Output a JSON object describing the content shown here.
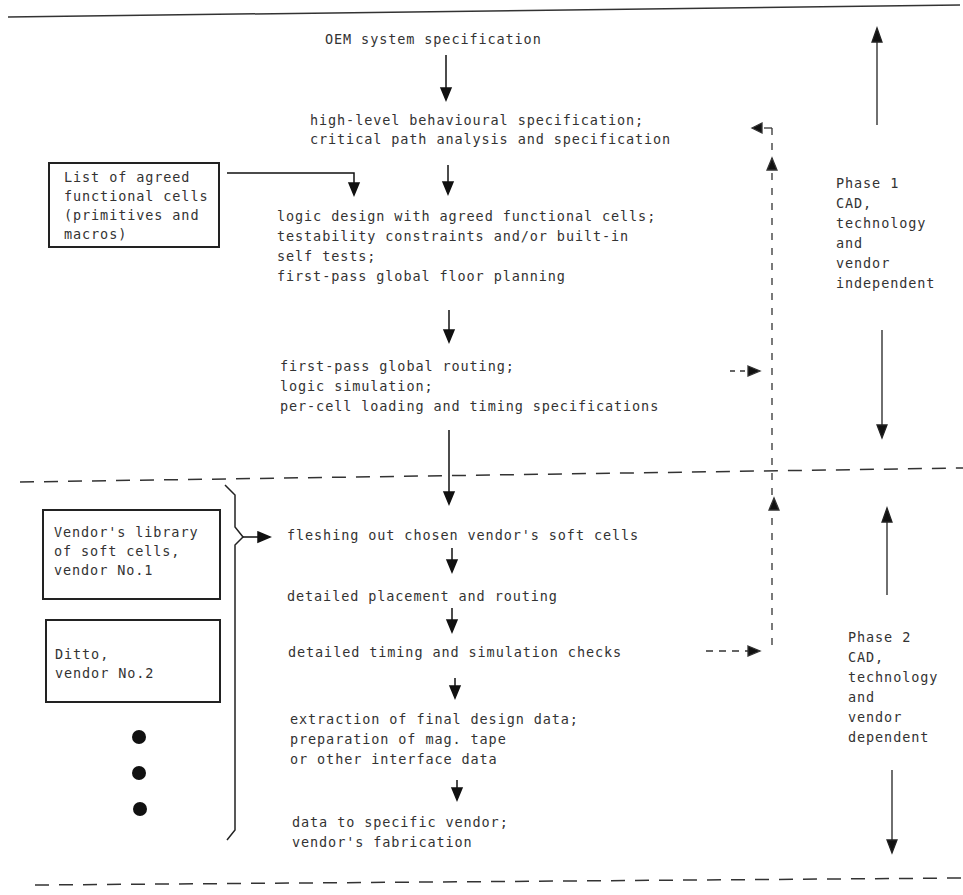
{
  "diagram": {
    "type": "flowchart",
    "phase1": {
      "steps": [
        [
          "OEM system specification"
        ],
        [
          "high-level behavioural specification;",
          "critical path analysis and specification"
        ],
        [
          "logic design with agreed functional cells;",
          "testability constraints and/or built-in",
          "self tests;",
          "first-pass global floor planning"
        ],
        [
          "first-pass global routing;",
          "logic simulation;",
          "per-cell loading and timing specifications"
        ]
      ],
      "input_box": [
        "List of agreed",
        "functional cells",
        "(primitives and",
        "macros)"
      ],
      "label": [
        "Phase 1",
        "CAD,",
        "technology",
        "and",
        "vendor",
        "independent"
      ]
    },
    "phase2": {
      "steps": [
        [
          "fleshing out chosen vendor's soft cells"
        ],
        [
          "detailed placement and routing"
        ],
        [
          "detailed timing and simulation checks"
        ],
        [
          "extraction of final design data;",
          "preparation of mag. tape",
          "or other interface data"
        ],
        [
          "data to specific vendor;",
          "vendor's fabrication"
        ]
      ],
      "vendor_boxes": [
        [
          "Vendor's library",
          "of soft cells,",
          "vendor No.1"
        ],
        [
          "Ditto,",
          "vendor No.2"
        ]
      ],
      "more_indicator": "•••",
      "label": [
        "Phase 2",
        "CAD,",
        "technology",
        "and",
        "vendor",
        "dependent"
      ]
    },
    "feedback_loops": [
      {
        "from": "first-pass global routing; logic simulation",
        "to": "high-level behavioural specification",
        "style": "dashed"
      },
      {
        "from": "detailed timing and simulation checks",
        "to": "high-level behavioural specification",
        "style": "dashed"
      }
    ]
  },
  "text": {
    "s1": "OEM system specification",
    "s2a": "high-level behavioural specification;",
    "s2b": "critical path analysis and specification",
    "s3a": "logic design with agreed functional cells;",
    "s3b": "testability constraints and/or built-in",
    "s3c": "self tests;",
    "s3d": "first-pass global floor planning",
    "s4a": "first-pass global routing;",
    "s4b": "logic simulation;",
    "s4c": "per-cell loading and timing specifications",
    "box1a": "List of agreed",
    "box1b": "functional cells",
    "box1c": "(primitives and",
    "box1d": "macros)",
    "p1a": "Phase 1",
    "p1b": "CAD,",
    "p1c": "technology",
    "p1d": "and",
    "p1e": "vendor",
    "p1f": "independent",
    "v1a": "Vendor's library",
    "v1b": "of soft cells,",
    "v1c": "vendor No.1",
    "v2a": "Ditto,",
    "v2b": "vendor No.2",
    "q1": "fleshing out chosen vendor's soft cells",
    "q2": "detailed placement and routing",
    "q3": "detailed timing and simulation checks",
    "q4a": "extraction of final design data;",
    "q4b": "preparation of mag. tape",
    "q4c": "or other interface data",
    "q5a": "data to specific vendor;",
    "q5b": "vendor's fabrication",
    "p2a": "Phase 2",
    "p2b": "CAD,",
    "p2c": "technology",
    "p2d": "and",
    "p2e": "vendor",
    "p2f": "dependent"
  }
}
